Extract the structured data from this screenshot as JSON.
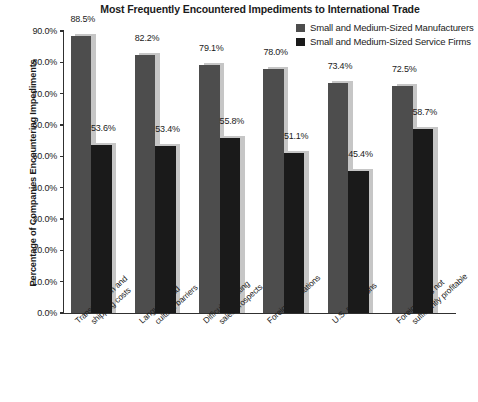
{
  "chart_data": {
    "type": "bar",
    "title": "Most Frequently Encountered Impediments to International Trade",
    "xlabel": "",
    "ylabel": "Percentage of Companies Encountering Impediments",
    "ylim": [
      0,
      90
    ],
    "ytick_labels": [
      "90.0%",
      "80.0%",
      "70.0%",
      "60.0%",
      "50.0%",
      "40.0%",
      "30.0%",
      "20.0%",
      "10.0%",
      "0.0%"
    ],
    "ytick_values": [
      90,
      80,
      70,
      60,
      50,
      40,
      30,
      20,
      10,
      0
    ],
    "grid": false,
    "legend_position": "top-right",
    "categories": [
      "Transportation and shipping costs",
      "Language and cultural barriers",
      "Difficulty locating sales prospects",
      "Foreign regulations",
      "U.S. regulations",
      "Foreign sales not sufficiently profitable"
    ],
    "category_lines": [
      [
        "Transportation and",
        "shipping costs"
      ],
      [
        "Language and",
        "cultural barriers"
      ],
      [
        "Difficulty locating",
        "sales prospects"
      ],
      [
        "Foreign regulations",
        ""
      ],
      [
        "U.S. regulations",
        ""
      ],
      [
        "Foreign sales not",
        "sufficiently profitable"
      ]
    ],
    "series": [
      {
        "name": "Small and Medium-Sized Manufacturers",
        "color": "#4d4d4d",
        "values": [
          88.5,
          82.2,
          79.1,
          78.0,
          73.4,
          72.5
        ],
        "labels": [
          "88.5%",
          "82.2%",
          "79.1%",
          "78.0%",
          "73.4%",
          "72.5%"
        ]
      },
      {
        "name": "Small and Medium-Sized Service Firms",
        "color": "#1a1a1a",
        "values": [
          53.6,
          53.4,
          55.8,
          51.1,
          45.4,
          58.7
        ],
        "labels": [
          "53.6%",
          "53.4%",
          "55.8%",
          "51.1%",
          "45.4%",
          "58.7%"
        ]
      }
    ]
  },
  "colors": {
    "axis": "#303030",
    "text": "#1b1b1b",
    "shadow": "#c6c6c6",
    "background": "#ffffff"
  }
}
